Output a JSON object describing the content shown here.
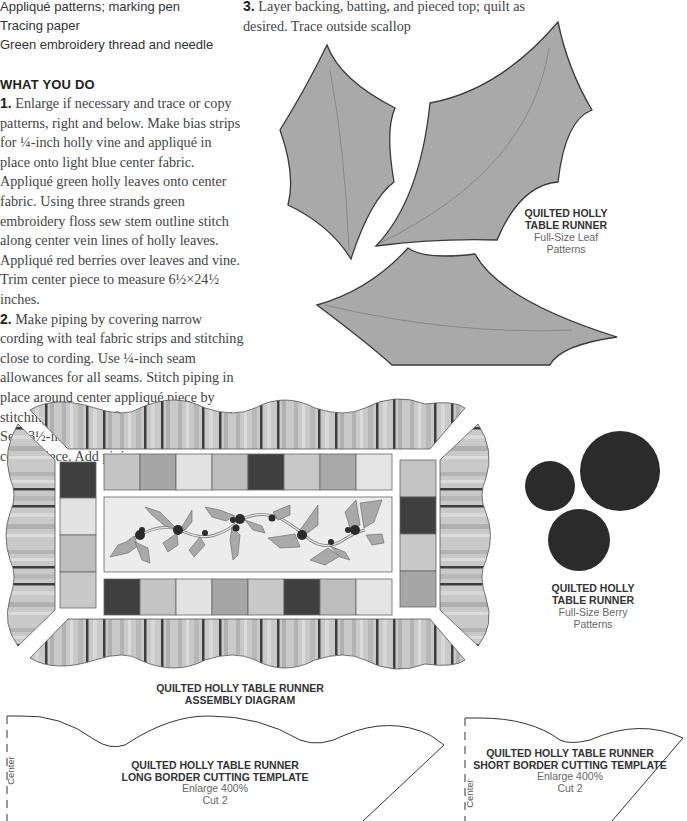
{
  "supplies": {
    "items": [
      "Appliqué patterns; marking pen",
      "Tracing paper",
      "Green embroidery thread and needle"
    ]
  },
  "instructions": {
    "heading": "WHAT YOU DO",
    "steps": [
      {
        "number": "1.",
        "text": "Enlarge if necessary and trace or copy patterns, right and below. Make bias strips for ¼-inch holly vine and appliqué in place onto light blue center fabric. Appliqué green holly leaves onto center fabric. Using three strands green embroidery floss sew stem outline stitch along center vein lines of holly leaves. Appliqué red berries over leaves and vine. Trim center piece to measure 6½×24½ inches."
      },
      {
        "number": "2.",
        "text": "Make piping by covering narrow cording with teal fabric strips and stitching close to cording. Use ¼-inch seam allowances for all seams. Stitch piping in place around center appliqué piece by stitching long sides first and then the ends. Sew 3½-inch squares together and sew to center piece. Add piping"
      },
      {
        "number": "3.",
        "text": "Layer backing, batting, and pieced top; quilt as desired. Trace outside scallop"
      }
    ]
  },
  "figures": {
    "leaf_patterns": {
      "title_line1": "QUILTED HOLLY",
      "title_line2": "TABLE RUNNER",
      "subtitle_line1": "Full-Size Leaf",
      "subtitle_line2": "Patterns"
    },
    "berry_patterns": {
      "title_line1": "QUILTED HOLLY",
      "title_line2": "TABLE RUNNER",
      "subtitle_line1": "Full-Size Berry",
      "subtitle_line2": "Patterns"
    },
    "assembly_diagram": {
      "title_line1": "QUILTED HOLLY TABLE RUNNER",
      "title_line2": "ASSEMBLY DIAGRAM",
      "top_row_squares": [
        "#c4c4c4",
        "#a6a6a6",
        "#e2e2e2",
        "#bdbdbd",
        "#3f3f3f",
        "#c8c8c8",
        "#a9a9a9",
        "#e4e4e4"
      ],
      "bottom_row_squares": [
        "#3f3f3f",
        "#c4c4c4",
        "#e2e2e2",
        "#a6a6a6",
        "#c8c8c8",
        "#3f3f3f",
        "#bdbdbd",
        "#e4e4e4"
      ],
      "left_column_squares": [
        "#3f3f3f",
        "#e2e2e2",
        "#bdbdbd",
        "#c8c8c8"
      ],
      "right_column_squares": [
        "#c4c4c4",
        "#3f3f3f",
        "#c8c8c8",
        "#a6a6a6"
      ]
    },
    "long_border_template": {
      "title_line1": "QUILTED HOLLY TABLE RUNNER",
      "title_line2": "LONG BORDER CUTTING TEMPLATE",
      "enlarge": "Enlarge 400%",
      "cut": "Cut 2",
      "center_label": "Center"
    },
    "short_border_template": {
      "title_line1": "QUILTED HOLLY TABLE RUNNER",
      "title_line2": "SHORT BORDER CUTTING TEMPLATE",
      "enlarge": "Enlarge 400%",
      "cut": "Cut 2",
      "center_label": "Center"
    }
  },
  "colors": {
    "leaf_fill": "#a9a9a9",
    "leaf_outline": "#3a3a3a",
    "berry_fill": "#2b2b2b",
    "stripe_dark": "#3d3d3d",
    "stripe_light": "#c9c9c9",
    "center_fabric": "#ececec"
  }
}
